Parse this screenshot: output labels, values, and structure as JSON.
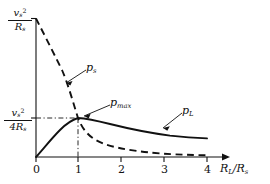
{
  "figure": {
    "background": "#ffffff",
    "ink": "#111111",
    "type": "line-chart"
  },
  "axes": {
    "x": {
      "label_html": "R<sub>L</sub>/R<sub>s</sub>",
      "label_plain": "R_L/R_s",
      "ticks": [
        "0",
        "1",
        "2",
        "3",
        "4"
      ],
      "range": [
        0,
        4.45
      ],
      "arrow": true
    },
    "y": {
      "top_label": {
        "num_html": "v<sub>s</sub><sup>2</sup>",
        "den_html": "R<sub>s</sub>",
        "plain": "v_s^2/R_s"
      },
      "mid_label": {
        "num_html": "v<sub>s</sub><sup>2</sup>",
        "den_html": "4R<sub>s</sub>",
        "plain": "v_s^2/(4R_s)"
      },
      "ticks": [
        "v_s^2/R_s",
        "v_s^2/(4R_s)"
      ],
      "range": [
        0,
        1.0
      ],
      "arrow": true
    }
  },
  "curves": [
    {
      "id": "ps",
      "label_html": "p<sub>s</sub>",
      "label_plain": "p_s",
      "style": "dashed",
      "color": "#111111"
    },
    {
      "id": "pL",
      "label_html": "p<sub>L</sub>",
      "label_plain": "p_L",
      "style": "solid",
      "color": "#111111"
    }
  ],
  "annotations": [
    {
      "id": "pmax",
      "label_html": "p<sub>max</sub>",
      "label_plain": "p_max",
      "leader": true
    }
  ],
  "guides": {
    "horizontal_at": "v_s^2/(4R_s)",
    "vertical_at": "1",
    "style": "dash-dot"
  },
  "chart_data": {
    "type": "line",
    "title": "",
    "xlabel": "R_L/R_s",
    "ylabel": "",
    "xlim": [
      0,
      4.45
    ],
    "ylim": [
      0,
      1.0
    ],
    "xticks": [
      0,
      1,
      2,
      3,
      4
    ],
    "yticks": [
      0.25,
      1.0
    ],
    "ytick_labels": [
      "v_s^2/(4R_s)",
      "v_s^2/R_s"
    ],
    "grid": false,
    "legend": "inline-labels",
    "annotations": [
      {
        "text": "p_max",
        "x": 1.0,
        "y": 0.25
      },
      {
        "text": "p_s",
        "x": 0.62,
        "y": 0.6
      },
      {
        "text": "p_L",
        "x": 2.92,
        "y": 0.345
      }
    ],
    "series": [
      {
        "name": "p_s",
        "note": "total power from source: p_s = v_s^2/((1+r)R_s), r = R_L/R_s",
        "style": "dashed",
        "x": [
          0.0,
          0.1,
          0.2,
          0.3,
          0.4,
          0.5,
          0.6,
          0.7,
          0.8,
          0.9,
          1.0,
          1.2,
          1.4,
          1.6,
          1.8,
          2.0,
          2.4,
          2.8,
          3.2,
          3.6,
          4.0
        ],
        "y": [
          1.0,
          0.909,
          0.833,
          0.769,
          0.714,
          0.667,
          0.625,
          0.588,
          0.556,
          0.526,
          0.5,
          0.455,
          0.417,
          0.385,
          0.357,
          0.333,
          0.294,
          0.263,
          0.238,
          0.217,
          0.2
        ]
      },
      {
        "name": "p_L",
        "note": "load power: p_L = r*v_s^2/((1+r)^2 R_s), peak 0.25 at r = 1",
        "style": "solid",
        "x": [
          0.0,
          0.1,
          0.2,
          0.3,
          0.4,
          0.5,
          0.6,
          0.7,
          0.8,
          0.9,
          1.0,
          1.2,
          1.4,
          1.6,
          1.8,
          2.0,
          2.4,
          2.8,
          3.2,
          3.6,
          4.0
        ],
        "y": [
          0.0,
          0.0826,
          0.139,
          0.178,
          0.204,
          0.222,
          0.234,
          0.242,
          0.247,
          0.249,
          0.25,
          0.248,
          0.243,
          0.237,
          0.23,
          0.222,
          0.208,
          0.194,
          0.181,
          0.17,
          0.16
        ]
      }
    ]
  }
}
